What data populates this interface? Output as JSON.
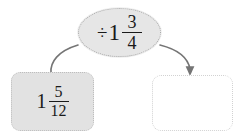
{
  "diagram": {
    "type": "bar-model-operation-flow",
    "background_color": "#ffffff",
    "nodes": {
      "given": {
        "name": "given-value-box",
        "shape": "rounded-rectangle",
        "fill_color": "#e2e2e2",
        "border_color": "#bdbdbd",
        "border_style": "dotted",
        "value": {
          "expression": "1 5/12",
          "whole": "1",
          "numerator": "5",
          "denominator": "12"
        }
      },
      "operation": {
        "name": "operation-ellipse",
        "shape": "ellipse",
        "fill_color": "#e6e6e6",
        "border_color": "#a9a9a9",
        "border_style": "dotted",
        "value": {
          "expression": "÷ 1 3/4",
          "operator": "÷",
          "whole": "1",
          "numerator": "3",
          "denominator": "4"
        }
      },
      "answer": {
        "name": "answer-box",
        "shape": "rounded-rectangle",
        "fill_color": "#ffffff",
        "border_color": "#d2d2d2",
        "border_style": "dotted",
        "value": {
          "expression": "",
          "placeholder": ""
        }
      }
    },
    "connectors": [
      {
        "name": "given-to-operation",
        "from": "given",
        "to": "operation",
        "style": "curved",
        "arrow": false,
        "color": "#757575"
      },
      {
        "name": "operation-to-answer",
        "from": "operation",
        "to": "answer",
        "style": "curved",
        "arrow": true,
        "color": "#757575"
      }
    ]
  }
}
